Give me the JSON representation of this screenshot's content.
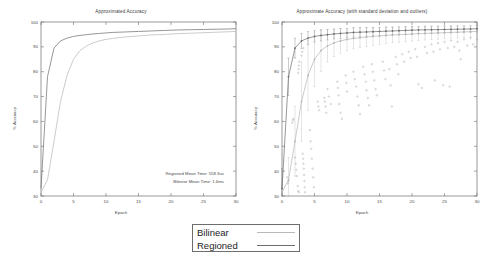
{
  "figure": {
    "background": "#ffffff",
    "series_colors": {
      "bilinear": "#b4b4b4",
      "regioned": "#6a6a6a"
    }
  },
  "legend": {
    "items": [
      {
        "label": "Bilinear",
        "color": "#b9b9b9"
      },
      {
        "label": "Regioned",
        "color": "#6e6e6e"
      }
    ]
  },
  "chart_data": [
    {
      "type": "line",
      "panel": "left",
      "title": "Approximated Accuracy",
      "xlabel": "Epoch",
      "ylabel": "% Accuracy",
      "xlim": [
        0,
        30
      ],
      "ylim": [
        30,
        100
      ],
      "xticks": [
        0,
        5,
        10,
        15,
        20,
        25,
        30
      ],
      "xticklabels": [
        "0",
        "5",
        "10",
        "15",
        "20",
        "25",
        "30"
      ],
      "yticks": [
        30,
        40,
        50,
        60,
        70,
        80,
        90,
        100
      ],
      "yticklabels": [
        "30",
        "40",
        "50",
        "60",
        "70",
        "80",
        "90",
        "100"
      ],
      "grid": false,
      "legend_position": "below-figure",
      "annotations": [
        "Regioned Mean Time: 558.3us",
        "Bilinear Mean Time: 1.6ms"
      ],
      "x": [
        0,
        1,
        2,
        3,
        4,
        5,
        6,
        7,
        8,
        9,
        10,
        11,
        12,
        13,
        14,
        15,
        16,
        17,
        18,
        19,
        20,
        21,
        22,
        23,
        24,
        25,
        26,
        27,
        28,
        29,
        30
      ],
      "series": [
        {
          "name": "Regioned",
          "color": "#6a6a6a",
          "values": [
            33.0,
            78.0,
            89.5,
            92.4,
            93.5,
            94.2,
            94.6,
            94.9,
            95.2,
            95.4,
            95.6,
            95.8,
            95.9,
            96.0,
            96.1,
            96.2,
            96.3,
            96.4,
            96.5,
            96.6,
            96.7,
            96.8,
            96.85,
            96.9,
            96.95,
            97.0,
            97.05,
            97.1,
            97.15,
            97.2,
            97.3
          ]
        },
        {
          "name": "Bilinear",
          "color": "#b4b4b4",
          "values": [
            31.5,
            36.5,
            52.0,
            68.0,
            78.5,
            85.0,
            88.5,
            90.4,
            91.6,
            92.4,
            93.0,
            93.4,
            93.7,
            94.0,
            94.2,
            94.4,
            94.6,
            94.8,
            94.9,
            95.0,
            95.15,
            95.3,
            95.4,
            95.5,
            95.6,
            95.7,
            95.8,
            95.9,
            96.0,
            96.1,
            96.2
          ]
        }
      ]
    },
    {
      "type": "line",
      "panel": "right",
      "title": "Approximate Accuracy (with standard deviation and outliers)",
      "xlabel": "Epoch",
      "ylabel": "% Accuracy",
      "xlim": [
        0,
        30
      ],
      "ylim": [
        30,
        100
      ],
      "xticks": [
        0,
        5,
        10,
        15,
        20,
        25,
        30
      ],
      "xticklabels": [
        "0",
        "5",
        "10",
        "15",
        "20",
        "25",
        "30"
      ],
      "yticks": [
        30,
        40,
        50,
        60,
        70,
        80,
        90,
        100
      ],
      "yticklabels": [
        "30",
        "40",
        "50",
        "60",
        "70",
        "80",
        "90",
        "100"
      ],
      "grid": false,
      "legend_position": "below-figure",
      "has_errorbars": true,
      "has_outliers": true,
      "x": [
        0,
        1,
        2,
        3,
        4,
        5,
        6,
        7,
        8,
        9,
        10,
        11,
        12,
        13,
        14,
        15,
        16,
        17,
        18,
        19,
        20,
        21,
        22,
        23,
        24,
        25,
        26,
        27,
        28,
        29,
        30
      ],
      "series": [
        {
          "name": "Regioned",
          "color": "#6a6a6a",
          "values": [
            33.0,
            78.0,
            89.5,
            92.4,
            93.5,
            94.2,
            94.6,
            94.9,
            95.2,
            95.4,
            95.6,
            95.8,
            95.9,
            96.0,
            96.1,
            96.2,
            96.3,
            96.4,
            96.5,
            96.6,
            96.7,
            96.8,
            96.85,
            96.9,
            96.95,
            97.0,
            97.05,
            97.1,
            97.15,
            97.2,
            97.3
          ],
          "errors": [
            8.0,
            7.5,
            4.0,
            3.0,
            2.6,
            2.3,
            2.2,
            2.1,
            2.0,
            2.0,
            1.9,
            1.9,
            1.8,
            1.8,
            1.7,
            1.7,
            1.7,
            1.6,
            1.6,
            1.6,
            1.5,
            1.5,
            1.5,
            1.5,
            1.4,
            1.4,
            1.4,
            1.4,
            1.3,
            1.3,
            1.3
          ]
        },
        {
          "name": "Bilinear",
          "color": "#b4b4b4",
          "values": [
            31.5,
            36.5,
            52.0,
            68.0,
            78.5,
            85.0,
            88.5,
            90.4,
            91.6,
            92.4,
            93.0,
            93.4,
            93.7,
            94.0,
            94.2,
            94.4,
            94.6,
            94.8,
            94.9,
            95.0,
            95.15,
            95.3,
            95.4,
            95.5,
            95.6,
            95.7,
            95.8,
            95.9,
            96.0,
            96.1,
            96.2
          ],
          "errors": [
            6.0,
            9.0,
            14.0,
            16.0,
            14.0,
            11.0,
            8.5,
            6.5,
            5.5,
            5.0,
            4.5,
            4.2,
            4.0,
            3.8,
            3.6,
            3.4,
            3.2,
            3.1,
            3.0,
            2.9,
            2.8,
            2.7,
            2.6,
            2.5,
            2.5,
            2.4,
            2.4,
            2.3,
            2.3,
            2.2,
            2.2
          ]
        }
      ],
      "outliers": [
        {
          "x": 0.8,
          "y": 37.5
        },
        {
          "x": 0.9,
          "y": 35.0
        },
        {
          "x": 1.0,
          "y": 36.0
        },
        {
          "x": 2.0,
          "y": 45.5
        },
        {
          "x": 2.1,
          "y": 43.0
        },
        {
          "x": 2.2,
          "y": 40.5
        },
        {
          "x": 2.3,
          "y": 38.0
        },
        {
          "x": 2.4,
          "y": 34.0
        },
        {
          "x": 2.5,
          "y": 32.0
        },
        {
          "x": 2.6,
          "y": 31.5
        },
        {
          "x": 1.6,
          "y": 59.5
        },
        {
          "x": 1.7,
          "y": 60.5
        },
        {
          "x": 1.75,
          "y": 61.0
        },
        {
          "x": 2.5,
          "y": 79.5
        },
        {
          "x": 2.55,
          "y": 81.0
        },
        {
          "x": 2.6,
          "y": 82.5
        },
        {
          "x": 2.65,
          "y": 84.0
        },
        {
          "x": 3.0,
          "y": 86.5
        },
        {
          "x": 3.1,
          "y": 88.0
        },
        {
          "x": 3.3,
          "y": 89.5
        },
        {
          "x": 3.2,
          "y": 47.0
        },
        {
          "x": 3.25,
          "y": 45.0
        },
        {
          "x": 3.3,
          "y": 43.0
        },
        {
          "x": 3.35,
          "y": 41.0
        },
        {
          "x": 3.4,
          "y": 38.5
        },
        {
          "x": 3.45,
          "y": 36.0
        },
        {
          "x": 3.5,
          "y": 33.5
        },
        {
          "x": 3.55,
          "y": 31.5
        },
        {
          "x": 4.3,
          "y": 56.5
        },
        {
          "x": 4.4,
          "y": 52.0
        },
        {
          "x": 4.5,
          "y": 49.0
        },
        {
          "x": 4.6,
          "y": 45.0
        },
        {
          "x": 4.7,
          "y": 41.0
        },
        {
          "x": 4.8,
          "y": 37.5
        },
        {
          "x": 4.9,
          "y": 33.5
        },
        {
          "x": 5.5,
          "y": 68.0
        },
        {
          "x": 5.6,
          "y": 66.0
        },
        {
          "x": 5.7,
          "y": 64.5
        },
        {
          "x": 6.5,
          "y": 69.5
        },
        {
          "x": 6.6,
          "y": 68.0
        },
        {
          "x": 6.7,
          "y": 66.0
        },
        {
          "x": 6.8,
          "y": 63.5
        },
        {
          "x": 7.0,
          "y": 73.0
        },
        {
          "x": 7.2,
          "y": 70.0
        },
        {
          "x": 7.5,
          "y": 67.0
        },
        {
          "x": 8.5,
          "y": 76.0
        },
        {
          "x": 8.6,
          "y": 73.5
        },
        {
          "x": 8.7,
          "y": 70.5
        },
        {
          "x": 8.8,
          "y": 67.0
        },
        {
          "x": 9.0,
          "y": 63.5
        },
        {
          "x": 9.2,
          "y": 61.0
        },
        {
          "x": 9.8,
          "y": 78.5
        },
        {
          "x": 9.9,
          "y": 75.5
        },
        {
          "x": 10.0,
          "y": 72.0
        },
        {
          "x": 11.0,
          "y": 80.0
        },
        {
          "x": 11.2,
          "y": 77.0
        },
        {
          "x": 11.4,
          "y": 74.0
        },
        {
          "x": 11.6,
          "y": 70.0
        },
        {
          "x": 11.8,
          "y": 66.5
        },
        {
          "x": 12.0,
          "y": 63.0
        },
        {
          "x": 12.5,
          "y": 82.0
        },
        {
          "x": 12.7,
          "y": 79.0
        },
        {
          "x": 12.9,
          "y": 76.0
        },
        {
          "x": 13.0,
          "y": 72.5
        },
        {
          "x": 13.2,
          "y": 69.5
        },
        {
          "x": 13.4,
          "y": 66.5
        },
        {
          "x": 13.8,
          "y": 83.0
        },
        {
          "x": 14.0,
          "y": 80.0
        },
        {
          "x": 14.2,
          "y": 76.5
        },
        {
          "x": 14.4,
          "y": 73.0
        },
        {
          "x": 14.6,
          "y": 70.5
        },
        {
          "x": 15.5,
          "y": 84.0
        },
        {
          "x": 15.7,
          "y": 80.5
        },
        {
          "x": 15.9,
          "y": 77.0
        },
        {
          "x": 16.5,
          "y": 81.0
        },
        {
          "x": 16.7,
          "y": 74.5
        },
        {
          "x": 16.9,
          "y": 66.0
        },
        {
          "x": 17.5,
          "y": 86.0
        },
        {
          "x": 17.7,
          "y": 83.0
        },
        {
          "x": 17.9,
          "y": 79.0
        },
        {
          "x": 18.5,
          "y": 87.0
        },
        {
          "x": 18.8,
          "y": 84.0
        },
        {
          "x": 19.5,
          "y": 88.0
        },
        {
          "x": 19.8,
          "y": 85.5
        },
        {
          "x": 20.5,
          "y": 89.0
        },
        {
          "x": 20.8,
          "y": 86.0
        },
        {
          "x": 21.0,
          "y": 75.0
        },
        {
          "x": 21.5,
          "y": 73.5
        },
        {
          "x": 22.0,
          "y": 90.0
        },
        {
          "x": 22.3,
          "y": 87.5
        },
        {
          "x": 23.0,
          "y": 91.0
        },
        {
          "x": 23.3,
          "y": 88.0
        },
        {
          "x": 23.5,
          "y": 76.5
        },
        {
          "x": 24.0,
          "y": 91.5
        },
        {
          "x": 24.3,
          "y": 89.0
        },
        {
          "x": 24.8,
          "y": 74.5
        },
        {
          "x": 25.0,
          "y": 92.0
        },
        {
          "x": 25.5,
          "y": 89.5
        },
        {
          "x": 25.8,
          "y": 74.0
        },
        {
          "x": 26.0,
          "y": 92.5
        },
        {
          "x": 26.5,
          "y": 90.0
        },
        {
          "x": 27.0,
          "y": 92.0
        },
        {
          "x": 27.3,
          "y": 88.5
        },
        {
          "x": 27.5,
          "y": 85.0
        },
        {
          "x": 28.0,
          "y": 93.0
        },
        {
          "x": 28.5,
          "y": 90.5
        },
        {
          "x": 29.0,
          "y": 93.5
        },
        {
          "x": 29.4,
          "y": 91.0
        },
        {
          "x": 30.0,
          "y": 93.0
        }
      ]
    }
  ]
}
